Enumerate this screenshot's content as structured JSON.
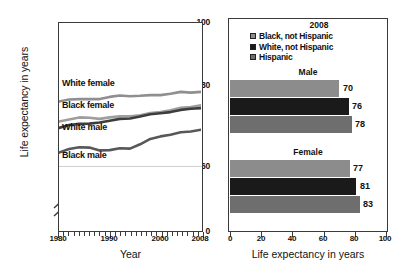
{
  "figure": {
    "panels": [
      "line-chart-trends",
      "bar-chart-2008"
    ]
  },
  "left_chart": {
    "y_axis_label": "Life expectancy in years",
    "x_axis_label": "Year",
    "y_ticks": [
      "0",
      "60",
      "80",
      "100"
    ],
    "x_ticks": [
      "1980",
      "1990",
      "2000",
      "2008"
    ],
    "axis_break": true,
    "series_labels": [
      "White female",
      "Black female",
      "White male",
      "Black male"
    ]
  },
  "right_chart": {
    "legend_title": "2008",
    "legend": [
      {
        "label": "Black, not Hispanic",
        "color": "#8c8c8c"
      },
      {
        "label": "White, not Hispanic",
        "color": "#1a1a1a"
      },
      {
        "label": "Hispanic",
        "color": "#6e6e6e"
      }
    ],
    "groups": [
      "Male",
      "Female"
    ],
    "x_axis_label": "Life expectancy in years",
    "x_ticks": [
      "0",
      "20",
      "40",
      "60",
      "80",
      "100"
    ],
    "values": {
      "male": [
        "70",
        "76",
        "78"
      ],
      "female": [
        "77",
        "81",
        "83"
      ]
    }
  },
  "chart_data": [
    {
      "type": "line",
      "title": "",
      "xlabel": "Year",
      "ylabel": "Life expectancy in years",
      "xlim": [
        1980,
        2008
      ],
      "ylim": [
        60,
        100
      ],
      "ytick_values": [
        0,
        60,
        80,
        100
      ],
      "xtick_values": [
        1980,
        1990,
        2000,
        2008
      ],
      "axis_break_between": [
        0,
        60
      ],
      "grid": false,
      "legend": "inline-labels",
      "x": [
        1980,
        1982,
        1984,
        1986,
        1988,
        1990,
        1992,
        1994,
        1996,
        1998,
        2000,
        2002,
        2004,
        2006,
        2008
      ],
      "series": [
        {
          "name": "White female",
          "color": "#8a8a8a",
          "values": [
            78.1,
            78.7,
            78.8,
            78.8,
            78.8,
            79.4,
            79.8,
            79.6,
            79.7,
            79.9,
            79.9,
            80.3,
            80.8,
            80.6,
            80.8
          ]
        },
        {
          "name": "Black female",
          "color": "#9a9a9a",
          "values": [
            72.5,
            73.0,
            73.6,
            73.5,
            73.2,
            73.6,
            73.9,
            73.9,
            74.2,
            74.8,
            75.1,
            75.6,
            76.3,
            76.5,
            77.0
          ]
        },
        {
          "name": "White male",
          "color": "#3b3b3b",
          "values": [
            70.7,
            71.5,
            71.8,
            71.9,
            72.2,
            72.7,
            73.2,
            73.3,
            73.9,
            74.5,
            74.8,
            75.1,
            75.7,
            76.0,
            76.2
          ]
        },
        {
          "name": "Black male",
          "color": "#555555",
          "values": [
            63.8,
            64.8,
            65.3,
            65.2,
            64.4,
            64.5,
            65.0,
            64.9,
            66.1,
            67.6,
            68.3,
            68.8,
            69.5,
            69.7,
            70.2
          ]
        }
      ]
    },
    {
      "type": "bar",
      "orientation": "horizontal",
      "title": "2008",
      "xlabel": "Life expectancy in years",
      "ylabel": "",
      "xlim": [
        0,
        100
      ],
      "xtick_values": [
        0,
        20,
        40,
        60,
        80,
        100
      ],
      "grid": false,
      "legend_position": "top-center",
      "categories": [
        "Male",
        "Female"
      ],
      "series": [
        {
          "name": "Black, not Hispanic",
          "color": "#8c8c8c",
          "values": [
            70,
            77
          ]
        },
        {
          "name": "White, not Hispanic",
          "color": "#1a1a1a",
          "values": [
            76,
            81
          ]
        },
        {
          "name": "Hispanic",
          "color": "#6e6e6e",
          "values": [
            78,
            83
          ]
        }
      ]
    }
  ]
}
